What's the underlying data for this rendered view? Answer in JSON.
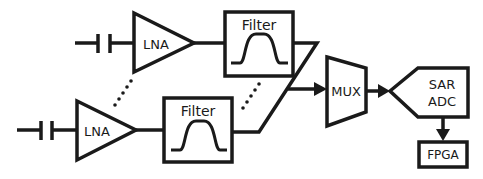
{
  "diagram": {
    "type": "block-diagram",
    "stroke_color": "#1a1a1a",
    "background": "#ffffff",
    "channels": [
      {
        "capacitor": {
          "label": ""
        },
        "lna": {
          "label": "LNA"
        },
        "filter": {
          "label": "Filter",
          "response_icon": "bandpass-curve-icon"
        }
      },
      {
        "capacitor": {
          "label": ""
        },
        "lna": {
          "label": "LNA"
        },
        "filter": {
          "label": "Filter",
          "response_icon": "bandpass-curve-icon"
        }
      }
    ],
    "mux": {
      "label": "MUX"
    },
    "adc": {
      "line1": "SAR",
      "line2": "ADC"
    },
    "fpga": {
      "label": "FPGA"
    },
    "ellipsis_marks": [
      "dotted-line-between-lnas",
      "dotted-line-between-filters"
    ]
  }
}
